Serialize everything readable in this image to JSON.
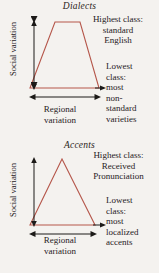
{
  "page": {
    "background_color": "#f4f2ef",
    "text_color": "#27211d",
    "shape_stroke_color": "#b5564a",
    "arrow_color": "#1c1a18"
  },
  "figures": [
    {
      "id": "dialects",
      "title": "Dialects",
      "shape": "trapezoid",
      "vertical_axis_label": "Social variation",
      "horizontal_axis_label_line1": "Regional",
      "horizontal_axis_label_line2": "variation",
      "top_annotation": {
        "line1": "Highest class:",
        "line2": "standard",
        "line3": "English"
      },
      "bottom_annotation": {
        "line1": "Lowest",
        "line2": "class:",
        "line3": "most",
        "line4": "non-",
        "line5": "standard",
        "line6": "varieties"
      }
    },
    {
      "id": "accents",
      "title": "Accents",
      "shape": "triangle",
      "vertical_axis_label": "Social variation",
      "horizontal_axis_label_line1": "Regional",
      "horizontal_axis_label_line2": "variation",
      "top_annotation": {
        "line1": "Highest class:",
        "line2": "Received",
        "line3": "Pronunciation"
      },
      "bottom_annotation": {
        "line1": "Lowest",
        "line2": "class:",
        "line3": "most",
        "line4": "localized",
        "line5": "accents"
      }
    }
  ]
}
